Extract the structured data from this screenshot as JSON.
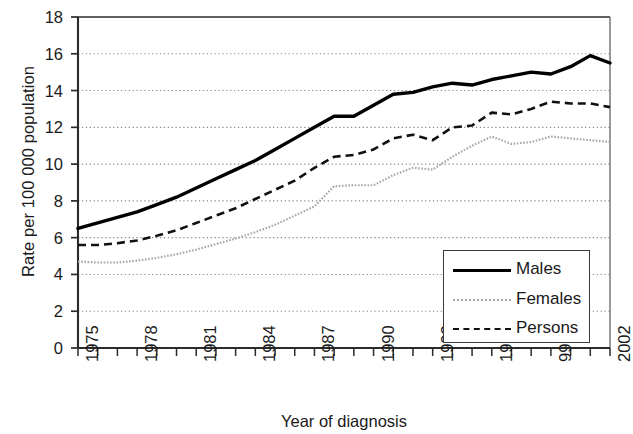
{
  "chart_data": {
    "type": "line",
    "title": "",
    "xlabel": "Year of diagnosis",
    "ylabel": "Rate per 100 000 population",
    "ylim": [
      0,
      18
    ],
    "xlim": [
      1975,
      2002
    ],
    "ytick_labels": [
      "0",
      "2",
      "4",
      "6",
      "8",
      "10",
      "12",
      "14",
      "16",
      "18"
    ],
    "ytick_values": [
      0,
      2,
      4,
      6,
      8,
      10,
      12,
      14,
      16,
      18
    ],
    "xtick_labels": [
      "1975",
      "1978",
      "1981",
      "1984",
      "1987",
      "1990",
      "1993",
      "1996",
      "999",
      "2002"
    ],
    "xtick_values": [
      1975,
      1978,
      1981,
      1984,
      1987,
      1990,
      1993,
      1996,
      1999,
      2002
    ],
    "grid": "horizontal-dotted",
    "legend_position": "bottom-right",
    "x": [
      1975,
      1976,
      1977,
      1978,
      1979,
      1980,
      1981,
      1982,
      1983,
      1984,
      1985,
      1986,
      1987,
      1988,
      1989,
      1990,
      1991,
      1992,
      1993,
      1994,
      1995,
      1996,
      1997,
      1998,
      1999,
      2000,
      2001,
      2002
    ],
    "series": [
      {
        "name": "Males",
        "color": "#000000",
        "style": "solid",
        "values": [
          6.5,
          6.8,
          7.1,
          7.4,
          7.8,
          8.2,
          8.7,
          9.2,
          9.7,
          10.2,
          10.8,
          11.4,
          12.0,
          12.6,
          12.6,
          13.2,
          13.8,
          13.9,
          14.2,
          14.4,
          14.3,
          14.6,
          14.8,
          15.0,
          14.9,
          15.3,
          15.9,
          15.5
        ]
      },
      {
        "name": "Females",
        "color": "#a8a8a8",
        "style": "dotted",
        "values": [
          4.7,
          4.65,
          4.65,
          4.75,
          4.9,
          5.1,
          5.35,
          5.65,
          5.95,
          6.3,
          6.7,
          7.2,
          7.7,
          8.8,
          8.85,
          8.85,
          9.4,
          9.8,
          9.7,
          10.4,
          11.0,
          11.5,
          11.1,
          11.2,
          11.5,
          11.4,
          11.3,
          11.2
        ]
      },
      {
        "name": "Persons",
        "color": "#111111",
        "style": "dashed",
        "values": [
          5.6,
          5.6,
          5.7,
          5.85,
          6.1,
          6.4,
          6.8,
          7.2,
          7.6,
          8.1,
          8.6,
          9.1,
          9.8,
          10.4,
          10.5,
          10.8,
          11.4,
          11.6,
          11.3,
          12.0,
          12.1,
          12.8,
          12.7,
          13.0,
          13.4,
          13.3,
          13.3,
          13.1
        ]
      }
    ]
  },
  "legend": {
    "items": [
      {
        "label": "Males"
      },
      {
        "label": "Females"
      },
      {
        "label": "Persons"
      }
    ]
  }
}
